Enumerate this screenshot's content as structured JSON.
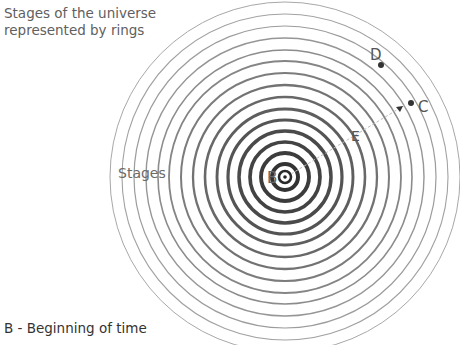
{
  "title": {
    "line1": "Stages of the universe",
    "line2": "represented by rings"
  },
  "labels": {
    "stages": "Stages",
    "B": "B",
    "C": "C",
    "D": "D",
    "E": "E"
  },
  "legend": {
    "items": [
      "B - Beginning of time"
    ]
  },
  "colors": {
    "ring_inner": "#3a3a3a",
    "ring_outer": "#9a9a9a",
    "dashed_line": "#bdbdbd",
    "text": "#555555"
  },
  "diagram": {
    "center": [
      285,
      177
    ],
    "ring_spacing_px": 12,
    "ring_count": 14,
    "outer_radius_px": 175
  }
}
